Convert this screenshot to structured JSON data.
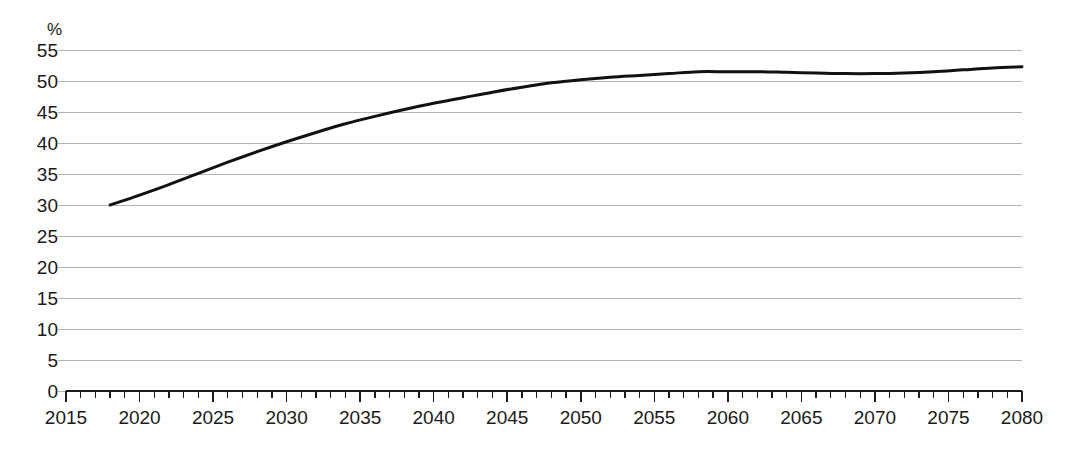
{
  "chart_data": {
    "type": "line",
    "title": "",
    "subtitle": "",
    "xlabel": "",
    "ylabel": "",
    "unit_label": "%",
    "xlim": [
      2015,
      2080
    ],
    "ylim": [
      0,
      55
    ],
    "grid": true,
    "legend": "none",
    "y_ticks": [
      0,
      5,
      10,
      15,
      20,
      25,
      30,
      35,
      40,
      45,
      50,
      55
    ],
    "y_tick_labels": [
      "0",
      "5",
      "10",
      "15",
      "20",
      "25",
      "30",
      "35",
      "40",
      "45",
      "50",
      "55"
    ],
    "x_ticks": [
      2015,
      2020,
      2025,
      2030,
      2035,
      2040,
      2045,
      2050,
      2055,
      2060,
      2065,
      2070,
      2075,
      2080
    ],
    "x_tick_labels": [
      "2015",
      "2020",
      "2025",
      "2030",
      "2035",
      "2040",
      "2045",
      "2050",
      "2055",
      "2060",
      "2065",
      "2070",
      "2075",
      "2080"
    ],
    "x_minor_tick_step": 1,
    "line_color": "#111111",
    "grid_color": "#b4b4b4",
    "axis_color": "#1a1a1a",
    "background_color": "#ffffff",
    "series": [
      {
        "name": "share",
        "x": [
          2018,
          2020,
          2022,
          2024,
          2026,
          2028,
          2030,
          2032,
          2034,
          2036,
          2038,
          2040,
          2042,
          2044,
          2046,
          2048,
          2050,
          2052,
          2054,
          2056,
          2058,
          2060,
          2062,
          2064,
          2066,
          2068,
          2070,
          2072,
          2074,
          2076,
          2078,
          2080
        ],
        "values": [
          30.0,
          31.6,
          33.3,
          35.1,
          36.9,
          38.6,
          40.2,
          41.7,
          43.1,
          44.3,
          45.4,
          46.4,
          47.3,
          48.2,
          49.0,
          49.7,
          50.2,
          50.6,
          50.9,
          51.2,
          51.5,
          51.5,
          51.5,
          51.4,
          51.3,
          51.2,
          51.2,
          51.3,
          51.5,
          51.8,
          52.1,
          52.3
        ]
      }
    ]
  }
}
